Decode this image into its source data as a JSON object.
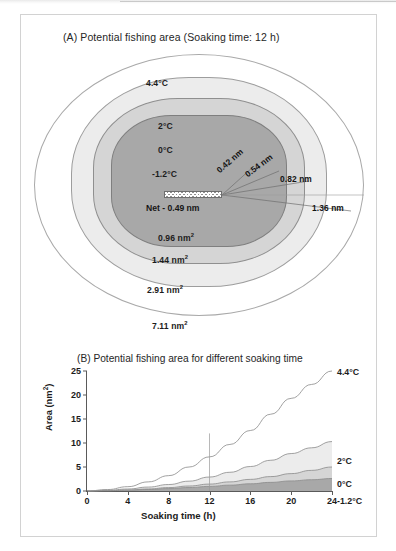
{
  "figure": {
    "panel_a": {
      "title": "(A) Potential fishing area (Soaking time: 12 h)",
      "soaking_time_h": 12,
      "net_label": "Net - 0.49 nm",
      "temperature_labels": [
        "4.4°C",
        "2°C",
        "0°C",
        "-1.2°C"
      ],
      "area_labels": [
        "0.96 nm²",
        "1.44 nm²",
        "2.91 nm²",
        "7.11 nm²"
      ],
      "distance_labels": [
        "0.42 nm",
        "0.54 nm",
        "0.82 nm",
        "1.36 nm"
      ],
      "contours": [
        {
          "temp": "4.4°C",
          "area": "7.11 nm²",
          "distance": "1.36 nm",
          "fill": "#ffffff"
        },
        {
          "temp": "2°C",
          "area": "2.91 nm²",
          "distance": "0.82 nm",
          "fill": "#ececec"
        },
        {
          "temp": "0°C",
          "area": "1.44 nm²",
          "distance": "0.54 nm",
          "fill": "#d5d5d5"
        },
        {
          "temp": "-1.2°C",
          "area": "0.96 nm²",
          "distance": "0.42 nm",
          "fill": "#a8a8a8"
        }
      ]
    },
    "panel_b": {
      "title": "(B) Potential fishing area for different soaking time"
    }
  },
  "chart_data": {
    "type": "area",
    "title": "(B) Potential fishing area for different soaking time",
    "xlabel": "Soaking time (h)",
    "ylabel": "Area (nm²)",
    "xlim": [
      0,
      24
    ],
    "ylim": [
      0,
      25
    ],
    "xticks": [
      0,
      4,
      8,
      12,
      16,
      20,
      24
    ],
    "yticks": [
      0,
      5,
      10,
      15,
      20,
      25
    ],
    "grid": false,
    "legend_position": "right-of-curves",
    "x": [
      0,
      2,
      4,
      6,
      8,
      10,
      12,
      14,
      16,
      18,
      20,
      22,
      24
    ],
    "series": [
      {
        "name": "4.4°C",
        "fill": "#ffffff",
        "values": [
          0,
          0.3,
          0.9,
          1.9,
          3.2,
          5.0,
          7.11,
          9.7,
          12.6,
          16.0,
          19.3,
          22.2,
          25.0
        ]
      },
      {
        "name": "2°C",
        "fill": "#ececec",
        "values": [
          0,
          0.15,
          0.42,
          0.82,
          1.35,
          2.05,
          2.91,
          3.9,
          5.1,
          6.4,
          7.8,
          9.0,
          10.3
        ]
      },
      {
        "name": "0°C",
        "fill": "#d5d5d5",
        "values": [
          0,
          0.08,
          0.22,
          0.43,
          0.71,
          1.04,
          1.44,
          1.9,
          2.42,
          3.0,
          3.62,
          4.3,
          5.0
        ]
      },
      {
        "name": "-1.2°C",
        "fill": "#a8a8a8",
        "values": [
          0,
          0.06,
          0.16,
          0.31,
          0.5,
          0.72,
          0.96,
          1.22,
          1.5,
          1.8,
          2.1,
          2.35,
          2.6
        ]
      }
    ],
    "annotations": [
      {
        "type": "vline",
        "x": 12,
        "y_top": 12,
        "label": "soaking time 12 h"
      }
    ]
  }
}
